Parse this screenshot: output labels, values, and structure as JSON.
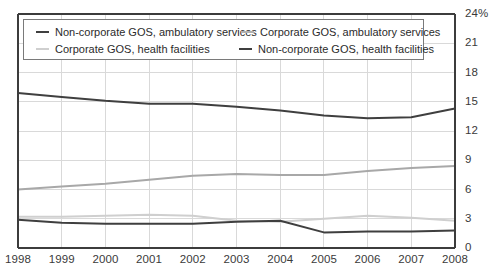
{
  "chart_data": {
    "type": "line",
    "title": "",
    "xlabel": "",
    "ylabel": "",
    "x": [
      1998,
      1999,
      2000,
      2001,
      2002,
      2003,
      2004,
      2005,
      2006,
      2007,
      2008
    ],
    "categories": [
      "1998",
      "1999",
      "2000",
      "2001",
      "2002",
      "2003",
      "2004",
      "2005",
      "2006",
      "2007",
      "2008"
    ],
    "ylim": [
      0,
      24
    ],
    "yticks": [
      0,
      3,
      6,
      9,
      12,
      15,
      18,
      21,
      24
    ],
    "ytick_labels": [
      "0",
      "3",
      "6",
      "9",
      "12",
      "15",
      "18",
      "21",
      "24%"
    ],
    "y_axis_position": "right",
    "grid": true,
    "legend_position": "top-left-inside",
    "series": [
      {
        "name": "Non-corporate GOS, ambulatory services",
        "color": "#3f3f3f",
        "width": 2.0,
        "values": [
          15.9,
          15.5,
          15.1,
          14.8,
          14.8,
          14.5,
          14.1,
          13.6,
          13.3,
          13.4,
          14.3
        ]
      },
      {
        "name": "Corporate GOS, ambulatory services",
        "color": "#a8a8a8",
        "width": 2.0,
        "values": [
          6.0,
          6.3,
          6.6,
          7.0,
          7.4,
          7.6,
          7.5,
          7.5,
          7.9,
          8.2,
          8.4
        ]
      },
      {
        "name": "Corporate GOS, health facilities",
        "color": "#cfcfcf",
        "width": 2.0,
        "values": [
          3.2,
          3.2,
          3.3,
          3.4,
          3.3,
          2.8,
          2.7,
          3.0,
          3.3,
          3.1,
          2.8
        ]
      },
      {
        "name": "Non-corporate GOS, health facilities",
        "color": "#3f3f3f",
        "width": 2.0,
        "values": [
          2.9,
          2.6,
          2.5,
          2.5,
          2.5,
          2.7,
          2.8,
          1.6,
          1.7,
          1.7,
          1.8
        ]
      }
    ]
  },
  "legend": {
    "entries": [
      {
        "label": "Non-corporate GOS, ambulatory services",
        "color": "#3f3f3f",
        "thickness": 2.6
      },
      {
        "label": "Corporate GOS, ambulatory services",
        "color": "#b0b0b0",
        "thickness": 2.0
      },
      {
        "label": "Corporate GOS, health facilities",
        "color": "#cfcfcf",
        "thickness": 2.0
      },
      {
        "label": "Non-corporate GOS, health facilities",
        "color": "#3f3f3f",
        "thickness": 2.6
      }
    ]
  },
  "axes": {
    "y_tick_labels": [
      "24%",
      "21",
      "18",
      "15",
      "12",
      "9",
      "6",
      "3",
      "0"
    ],
    "x_tick_labels": [
      "1998",
      "1999",
      "2000",
      "2001",
      "2002",
      "2003",
      "2004",
      "2005",
      "2006",
      "2007",
      "2008"
    ]
  },
  "colors": {
    "dark_series": "#3f3f3f",
    "mid_series": "#a8a8a8",
    "light_series": "#cfcfcf",
    "grid": "#d9d9d9",
    "axis": "#3c3c3c",
    "text": "#3a3a3a"
  }
}
